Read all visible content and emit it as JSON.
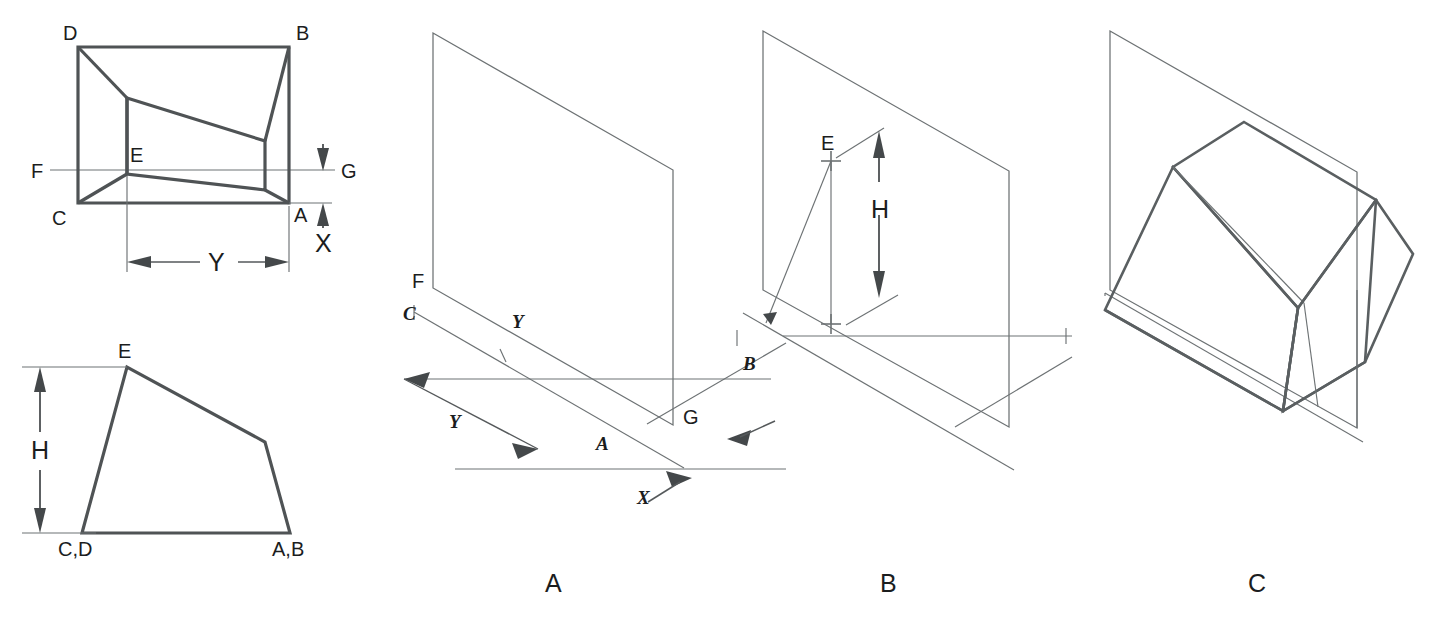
{
  "figure": {
    "background_color": "#ffffff",
    "line_color": "#4f5355",
    "plane_line_color": "#6d7274",
    "text_color": "#1b1d1e"
  },
  "top_view": {
    "name": "top-view",
    "corner_labels": {
      "top_left": "D",
      "top_right": "B",
      "bottom_left": "C",
      "bottom_right": "A",
      "apex": "E"
    },
    "cutting_plane_labels": {
      "left": "F",
      "right": "G"
    },
    "dimensions": [
      {
        "id": "Y",
        "label": "Y",
        "orientation": "horizontal"
      },
      {
        "id": "X",
        "label": "X",
        "orientation": "vertical"
      }
    ]
  },
  "front_view": {
    "name": "front-view",
    "labels": {
      "apex": "E",
      "bottom_left": "C,D",
      "bottom_right": "A,B"
    },
    "dimensions": [
      {
        "id": "H",
        "label": "H",
        "orientation": "vertical"
      }
    ]
  },
  "panels": [
    {
      "id": "A",
      "caption": "A",
      "labels": [
        "F",
        "C",
        "Y",
        "Y",
        "A",
        "G",
        "B",
        "X"
      ],
      "point_labels": {
        "plane_top_left": "F",
        "ground_left": "C",
        "tick_y": "Y",
        "dim_y": "Y",
        "point_a": "A",
        "plane_bottom_right": "G",
        "point_b": "B",
        "dim_x": "X"
      }
    },
    {
      "id": "B",
      "caption": "B",
      "labels": [
        "E",
        "H",
        "B"
      ],
      "point_labels": {
        "apex": "E",
        "dim_h": "H",
        "point_b": "B"
      }
    },
    {
      "id": "C",
      "caption": "C",
      "labels": [],
      "description": "completed isometric solid intersecting the plane"
    }
  ]
}
